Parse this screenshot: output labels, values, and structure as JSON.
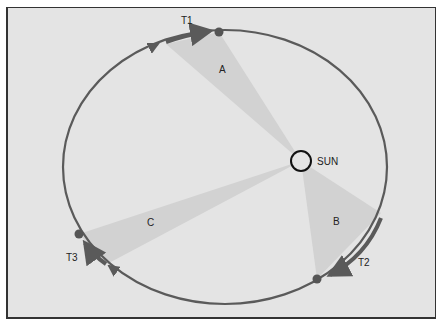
{
  "diagram": {
    "colors": {
      "background": "#e4e4e4",
      "orbit": "#5a5a5a",
      "sector": "#d2d2d2",
      "sun_outline": "#111111",
      "planet": "#555555"
    },
    "sun_label": "SUN",
    "time_labels": {
      "t1": "T1",
      "t2": "T2",
      "t3": "T3"
    },
    "sector_labels": {
      "a": "A",
      "b": "B",
      "c": "C"
    }
  }
}
